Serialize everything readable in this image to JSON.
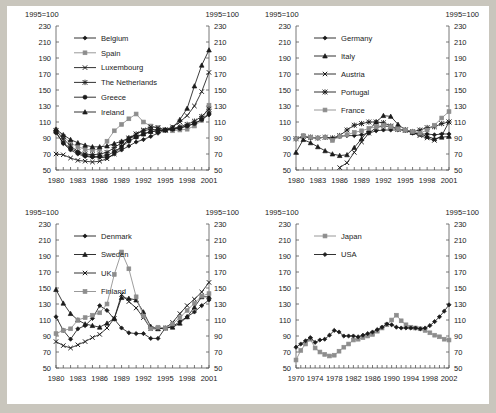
{
  "page": {
    "background": "#c9c6bd",
    "sheet_background": "#ffffff",
    "unit_note": "1995=100"
  },
  "common": {
    "y_label_left": "1995=100",
    "y_label_right": "1995=100",
    "y_ticks": [
      50,
      70,
      90,
      110,
      130,
      150,
      170,
      190,
      210,
      230
    ],
    "ylim": [
      50,
      230
    ],
    "marker_colors": {
      "dark": "#1b1b1b",
      "gray": "#8d8d8d"
    }
  },
  "chart_data": [
    {
      "id": "panel-1",
      "type": "line",
      "title": "",
      "xlabel": "",
      "ylabel": "1995=100",
      "header_left": "1995=100",
      "header_right": "1995=100",
      "grid": false,
      "legend_position": "top-left",
      "ylim": [
        50,
        230
      ],
      "y_ticks": [
        50,
        70,
        90,
        110,
        130,
        150,
        170,
        190,
        210,
        230
      ],
      "xlim": [
        1980,
        2001
      ],
      "x_ticks": [
        1980,
        1983,
        1986,
        1989,
        1992,
        1995,
        1998,
        2001
      ],
      "x": [
        1980,
        1981,
        1982,
        1983,
        1984,
        1985,
        1986,
        1987,
        1988,
        1989,
        1990,
        1991,
        1992,
        1993,
        1994,
        1995,
        1996,
        1997,
        1998,
        1999,
        2000,
        2001
      ],
      "series": [
        {
          "name": "Belgium",
          "marker": "diamond",
          "color": "#1b1b1b",
          "values": [
            97,
            83,
            75,
            70,
            67,
            66,
            66,
            65,
            70,
            75,
            80,
            85,
            88,
            92,
            96,
            100,
            101,
            103,
            105,
            108,
            113,
            119
          ]
        },
        {
          "name": "Spain",
          "marker": "square",
          "color": "#8d8d8d",
          "values": [
            100,
            92,
            84,
            79,
            76,
            75,
            76,
            86,
            99,
            107,
            114,
            120,
            110,
            105,
            103,
            100,
            99,
            100,
            101,
            105,
            112,
            131
          ]
        },
        {
          "name": "Luxembourg",
          "marker": "x",
          "color": "#1b1b1b",
          "values": [
            70,
            69,
            65,
            62,
            61,
            60,
            61,
            64,
            70,
            79,
            89,
            95,
            100,
            104,
            103,
            100,
            104,
            110,
            118,
            130,
            148,
            172
          ]
        },
        {
          "name": "The Netherlands",
          "marker": "asterisk",
          "color": "#1b1b1b",
          "values": [
            99,
            89,
            80,
            73,
            70,
            69,
            70,
            72,
            78,
            84,
            90,
            95,
            99,
            101,
            100,
            100,
            102,
            104,
            107,
            111,
            117,
            126
          ]
        },
        {
          "name": "Greece",
          "marker": "circle",
          "color": "#1b1b1b",
          "values": [
            97,
            84,
            77,
            72,
            68,
            67,
            67,
            68,
            73,
            79,
            86,
            91,
            95,
            98,
            99,
            100,
            101,
            102,
            105,
            108,
            113,
            121
          ]
        },
        {
          "name": "Ireland",
          "marker": "triangle",
          "color": "#1b1b1b",
          "values": [
            101,
            94,
            88,
            84,
            81,
            79,
            79,
            80,
            83,
            86,
            90,
            92,
            95,
            98,
            99,
            100,
            103,
            113,
            127,
            155,
            181,
            200
          ]
        }
      ]
    },
    {
      "id": "panel-2",
      "type": "line",
      "title": "",
      "xlabel": "",
      "ylabel": "1995=100",
      "header_left": "1995=100",
      "header_right": "1995=100",
      "grid": false,
      "legend_position": "top-left",
      "ylim": [
        50,
        230
      ],
      "y_ticks": [
        50,
        70,
        90,
        110,
        130,
        150,
        170,
        190,
        210,
        230
      ],
      "xlim": [
        1980,
        2001
      ],
      "x_ticks": [
        1980,
        1983,
        1986,
        1989,
        1992,
        1995,
        1998,
        2001
      ],
      "x": [
        1980,
        1981,
        1982,
        1983,
        1984,
        1985,
        1986,
        1987,
        1988,
        1989,
        1990,
        1991,
        1992,
        1993,
        1994,
        1995,
        1996,
        1997,
        1998,
        1999,
        2000,
        2001
      ],
      "series": [
        {
          "name": "Germany",
          "marker": "diamond",
          "color": "#1b1b1b",
          "values": [
            89,
            92,
            90,
            90,
            91,
            89,
            92,
            93,
            93,
            94,
            96,
            99,
            100,
            100,
            100,
            100,
            96,
            95,
            95,
            94,
            95,
            95
          ]
        },
        {
          "name": "Italy",
          "marker": "triangle",
          "color": "#1b1b1b",
          "values": [
            72,
            88,
            84,
            79,
            74,
            70,
            68,
            69,
            78,
            89,
            100,
            110,
            118,
            117,
            107,
            100,
            97,
            95,
            92,
            89,
            91,
            92
          ]
        },
        {
          "name": "Austria",
          "marker": "x",
          "color": "#1b1b1b",
          "values": [
            null,
            null,
            null,
            null,
            null,
            null,
            53,
            59,
            72,
            85,
            96,
            103,
            105,
            104,
            101,
            100,
            97,
            93,
            90,
            87,
            93,
            110
          ]
        },
        {
          "name": "Portugal",
          "marker": "asterisk",
          "color": "#1b1b1b",
          "values": [
            89,
            92,
            91,
            90,
            91,
            90,
            93,
            100,
            106,
            108,
            110,
            110,
            109,
            105,
            101,
            100,
            98,
            100,
            103,
            104,
            108,
            110
          ]
        },
        {
          "name": "France",
          "marker": "square",
          "color": "#8d8d8d",
          "values": [
            89,
            93,
            91,
            90,
            91,
            87,
            92,
            94,
            97,
            99,
            102,
            104,
            106,
            104,
            101,
            100,
            98,
            96,
            100,
            106,
            115,
            123
          ]
        }
      ]
    },
    {
      "id": "panel-3",
      "type": "line",
      "title": "",
      "xlabel": "",
      "ylabel": "1995=100",
      "header_left": "1995=100",
      "header_right": "1995=100",
      "grid": false,
      "legend_position": "top-left",
      "ylim": [
        50,
        230
      ],
      "y_ticks": [
        50,
        70,
        90,
        110,
        130,
        150,
        170,
        190,
        210,
        230
      ],
      "xlim": [
        1980,
        2001
      ],
      "x_ticks": [
        1980,
        1983,
        1986,
        1989,
        1992,
        1995,
        1998,
        2001
      ],
      "x": [
        1980,
        1981,
        1982,
        1983,
        1984,
        1985,
        1986,
        1987,
        1988,
        1989,
        1990,
        1991,
        1992,
        1993,
        1994,
        1995,
        1996,
        1997,
        1998,
        1999,
        2000,
        2001
      ],
      "series": [
        {
          "name": "Denmark",
          "marker": "diamond",
          "color": "#1b1b1b",
          "values": [
            114,
            97,
            86,
            99,
            103,
            112,
            128,
            122,
            111,
            100,
            94,
            93,
            93,
            87,
            87,
            100,
            102,
            108,
            114,
            120,
            128,
            135
          ]
        },
        {
          "name": "Sweden",
          "marker": "triangle",
          "color": "#1b1b1b",
          "values": [
            148,
            131,
            118,
            110,
            105,
            103,
            101,
            106,
            112,
            138,
            137,
            135,
            120,
            102,
            99,
            100,
            101,
            106,
            114,
            126,
            139,
            139
          ]
        },
        {
          "name": "UK",
          "marker": "x",
          "color": "#1b1b1b",
          "values": [
            83,
            78,
            75,
            79,
            83,
            88,
            92,
            100,
            112,
            142,
            133,
            125,
            113,
            99,
            99,
            100,
            107,
            118,
            128,
            136,
            145,
            157
          ]
        },
        {
          "name": "Finland",
          "marker": "square",
          "color": "#8d8d8d",
          "values": [
            93,
            97,
            99,
            110,
            113,
            116,
            119,
            130,
            167,
            195,
            174,
            139,
            115,
            99,
            101,
            100,
            105,
            113,
            122,
            131,
            140,
            143
          ]
        }
      ]
    },
    {
      "id": "panel-4",
      "type": "line",
      "title": "",
      "xlabel": "",
      "ylabel": "1995=100",
      "header_left": "1995=100",
      "header_right": "1995=100",
      "grid": false,
      "legend_position": "top-left",
      "ylim": [
        50,
        230
      ],
      "y_ticks": [
        50,
        70,
        90,
        110,
        130,
        150,
        170,
        190,
        210,
        230
      ],
      "xlim": [
        1970,
        2002
      ],
      "x_ticks": [
        1970,
        1974,
        1978,
        1982,
        1986,
        1990,
        1994,
        1998,
        2002
      ],
      "x": [
        1970,
        1971,
        1972,
        1973,
        1974,
        1975,
        1976,
        1977,
        1978,
        1979,
        1980,
        1981,
        1982,
        1983,
        1984,
        1985,
        1986,
        1987,
        1988,
        1989,
        1990,
        1991,
        1992,
        1993,
        1994,
        1995,
        1996,
        1997,
        1998,
        1999,
        2000,
        2001,
        2002
      ],
      "series": [
        {
          "name": "Japan",
          "marker": "square",
          "color": "#8d8d8d",
          "values": [
            60,
            72,
            80,
            86,
            75,
            70,
            67,
            65,
            66,
            71,
            76,
            80,
            85,
            86,
            88,
            90,
            92,
            96,
            100,
            104,
            110,
            116,
            109,
            104,
            101,
            100,
            99,
            97,
            94,
            91,
            89,
            86,
            85
          ]
        },
        {
          "name": "USA",
          "marker": "diamond",
          "color": "#1b1b1b",
          "values": [
            76,
            80,
            84,
            88,
            82,
            85,
            86,
            91,
            97,
            95,
            90,
            90,
            90,
            89,
            91,
            93,
            95,
            98,
            101,
            105,
            104,
            101,
            100,
            100,
            100,
            100,
            99,
            100,
            103,
            108,
            114,
            121,
            129
          ]
        }
      ]
    }
  ]
}
